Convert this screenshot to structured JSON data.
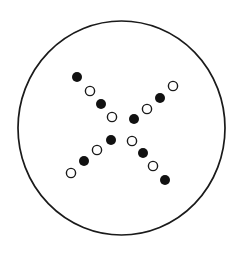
{
  "diagram": {
    "type": "circle-with-dot-cross",
    "colors": {
      "stroke": "#1a1a1a",
      "filled": "#111111",
      "open_fill": "#ffffff",
      "background": "#ffffff"
    },
    "outline": {
      "shape": "ellipse",
      "cx": 121.5,
      "cy": 128,
      "rx": 103.5,
      "ry": 107
    },
    "arms": [
      {
        "name": "upper-left",
        "dots": [
          {
            "x": 77,
            "y": 77,
            "filled": true
          },
          {
            "x": 90,
            "y": 91,
            "filled": false
          },
          {
            "x": 101,
            "y": 104,
            "filled": true
          },
          {
            "x": 112,
            "y": 117,
            "filled": false
          }
        ]
      },
      {
        "name": "upper-right",
        "dots": [
          {
            "x": 173,
            "y": 86,
            "filled": false
          },
          {
            "x": 160,
            "y": 98,
            "filled": true
          },
          {
            "x": 147,
            "y": 109,
            "filled": false
          },
          {
            "x": 134,
            "y": 119,
            "filled": true
          }
        ]
      },
      {
        "name": "lower-left",
        "dots": [
          {
            "x": 111,
            "y": 140,
            "filled": true
          },
          {
            "x": 97,
            "y": 150,
            "filled": false
          },
          {
            "x": 84,
            "y": 161,
            "filled": true
          },
          {
            "x": 71,
            "y": 173,
            "filled": false
          }
        ]
      },
      {
        "name": "lower-right",
        "dots": [
          {
            "x": 132,
            "y": 141,
            "filled": false
          },
          {
            "x": 143,
            "y": 153,
            "filled": true
          },
          {
            "x": 153,
            "y": 166,
            "filled": false
          },
          {
            "x": 165,
            "y": 180,
            "filled": true
          }
        ]
      }
    ],
    "dot_radius_filled": 5,
    "dot_radius_open": 4.6
  }
}
